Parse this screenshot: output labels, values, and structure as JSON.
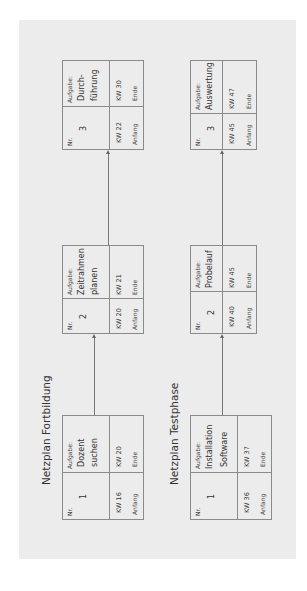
{
  "diagrams": [
    {
      "title": "Netzplan Fortbildung",
      "nodes": [
        {
          "nr_label": "Nr.",
          "nr": "1",
          "task_label": "Aufgabe:",
          "task_lines": [
            "Dozent",
            "suchen"
          ],
          "start_week": "KW 16",
          "start_label": "Anfang",
          "end_week": "KW 20",
          "end_label": "Ende"
        },
        {
          "nr_label": "Nr.",
          "nr": "2",
          "task_label": "Aufgabe:",
          "task_lines": [
            "Zeitrahmen",
            "planen"
          ],
          "start_week": "KW 20",
          "start_label": "Anfang",
          "end_week": "KW 21",
          "end_label": "Ende"
        },
        {
          "nr_label": "Nr.",
          "nr": "3",
          "task_label": "Aufgabe:",
          "task_lines": [
            "Durch-",
            "führung"
          ],
          "start_week": "KW 22",
          "start_label": "Anfang",
          "end_week": "KW 30",
          "end_label": "Ende"
        }
      ],
      "edges": [
        {
          "from": "1",
          "to": "2"
        },
        {
          "from": "2",
          "to": "3"
        }
      ]
    },
    {
      "title": "Netzplan Testphase",
      "nodes": [
        {
          "nr_label": "Nr.",
          "nr": "1",
          "task_label": "Aufgabe:",
          "task_lines": [
            "Installation",
            "Software"
          ],
          "start_week": "KW 36",
          "start_label": "Anfang",
          "end_week": "KW 37",
          "end_label": "Ende"
        },
        {
          "nr_label": "Nr.",
          "nr": "2",
          "task_label": "Aufgabe:",
          "task_lines": [
            "Probelauf"
          ],
          "start_week": "KW 40",
          "start_label": "Anfang",
          "end_week": "KW 45",
          "end_label": "Ende"
        },
        {
          "nr_label": "Nr.",
          "nr": "3",
          "task_label": "Aufgabe:",
          "task_lines": [
            "Auswertung"
          ],
          "start_week": "KW 45",
          "start_label": "Anfang",
          "end_week": "KW 47",
          "end_label": "Ende"
        }
      ],
      "edges": [
        {
          "from": "1",
          "to": "2"
        },
        {
          "from": "2",
          "to": "3"
        }
      ]
    }
  ],
  "colors": {
    "panel": "#ececec",
    "border": "#8a8a8a",
    "text": "#333333"
  }
}
